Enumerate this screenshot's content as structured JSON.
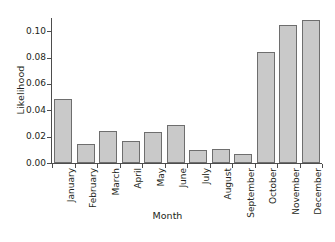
{
  "chart_data": {
    "type": "bar",
    "title": "",
    "xlabel": "Month",
    "ylabel": "Likelihood",
    "categories": [
      "January",
      "February",
      "March",
      "April",
      "May",
      "June",
      "July",
      "August",
      "September",
      "October",
      "November",
      "December"
    ],
    "values": [
      0.0485,
      0.0148,
      0.0245,
      0.0168,
      0.0233,
      0.0288,
      0.0095,
      0.011,
      0.0068,
      0.0845,
      0.1048,
      0.1083
    ],
    "ylim": [
      0.0,
      0.11
    ],
    "ytick_values": [
      0.0,
      0.02,
      0.04,
      0.06,
      0.08,
      0.1
    ],
    "ytick_labels": [
      "0.00",
      "0.02",
      "0.04",
      "0.06",
      "0.08",
      "0.10"
    ],
    "grid": false,
    "legend": null,
    "bar_color": "#c9c9c9",
    "bar_border_color": "#6e6e6e",
    "axis_color": "#4d4d4d",
    "text_color": "#231f20",
    "background": "#ffffff"
  }
}
